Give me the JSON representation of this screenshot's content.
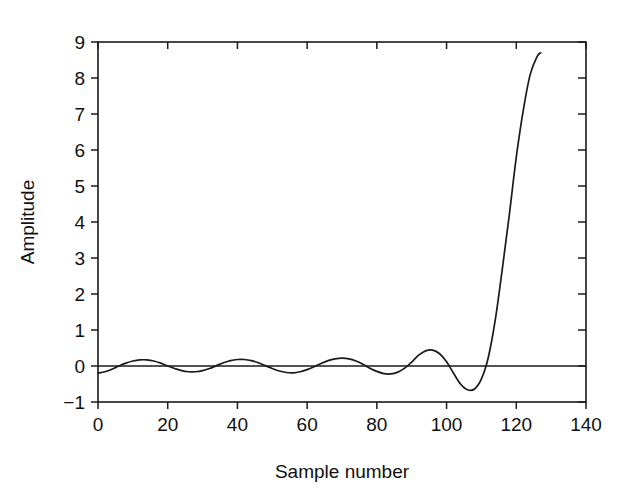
{
  "chart_data": {
    "type": "line",
    "title": "",
    "subtitle": "",
    "xlabel": "Sample number",
    "ylabel": "Amplitude",
    "xlim": [
      0,
      140
    ],
    "ylim": [
      -1,
      9
    ],
    "grid": false,
    "legend": null,
    "x_ticks": [
      0,
      20,
      40,
      60,
      80,
      100,
      120,
      140
    ],
    "x_tick_labels": [
      "0",
      "20",
      "40",
      "60",
      "80",
      "100",
      "120",
      "140"
    ],
    "y_ticks": [
      -1,
      0,
      1,
      2,
      3,
      4,
      5,
      6,
      7,
      8,
      9
    ],
    "y_tick_labels": [
      "−1",
      "0",
      "1",
      "2",
      "3",
      "4",
      "5",
      "6",
      "7",
      "8",
      "9"
    ],
    "annotations": [],
    "zero_reference_line": 0,
    "series": [
      {
        "name": "waveform",
        "color": "#1a1a1a",
        "x_start": 0,
        "x_end": 127,
        "y_max": 8.7,
        "y_min": -0.68,
        "description": "Low-amplitude oscillation growing into a steep exponential rise",
        "x": [
          0,
          2,
          4,
          6,
          8,
          10,
          12,
          14,
          16,
          18,
          20,
          22,
          24,
          26,
          28,
          30,
          32,
          34,
          36,
          38,
          40,
          42,
          44,
          46,
          48,
          50,
          52,
          54,
          56,
          58,
          60,
          62,
          64,
          66,
          68,
          70,
          72,
          74,
          76,
          78,
          80,
          82,
          84,
          86,
          88,
          90,
          92,
          94,
          96,
          98,
          100,
          102,
          104,
          106,
          108,
          110,
          112,
          114,
          116,
          118,
          120,
          122,
          124,
          126,
          127
        ],
        "y": [
          -0.2,
          -0.16,
          -0.09,
          0.0,
          0.08,
          0.14,
          0.17,
          0.17,
          0.14,
          0.08,
          0.0,
          -0.07,
          -0.13,
          -0.16,
          -0.16,
          -0.13,
          -0.07,
          0.01,
          0.09,
          0.15,
          0.18,
          0.18,
          0.15,
          0.09,
          0.01,
          -0.07,
          -0.14,
          -0.18,
          -0.19,
          -0.16,
          -0.1,
          -0.02,
          0.07,
          0.15,
          0.2,
          0.22,
          0.2,
          0.14,
          0.05,
          -0.06,
          -0.15,
          -0.21,
          -0.22,
          -0.17,
          -0.06,
          0.11,
          0.3,
          0.42,
          0.44,
          0.34,
          0.12,
          -0.2,
          -0.5,
          -0.66,
          -0.64,
          -0.36,
          0.25,
          1.3,
          2.7,
          4.2,
          5.8,
          7.1,
          8.1,
          8.6,
          8.7
        ]
      }
    ]
  },
  "axes": {
    "x_axis_name": "sample-number-axis",
    "y_axis_name": "amplitude-axis"
  }
}
